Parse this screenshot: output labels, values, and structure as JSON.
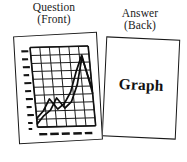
{
  "scene": {
    "kind": "flashcard-illustration",
    "background_color": "#ffffff",
    "ink_color": "#181818"
  },
  "question_card": {
    "caption_line1": "Question",
    "caption_line2": "(Front)",
    "border_color": "#181818",
    "fill_color": "#ffffff"
  },
  "answer_card": {
    "caption_line1": "Answer",
    "caption_line2": "(Back)",
    "label": "Graph",
    "border_color": "#181818",
    "fill_color": "#ffffff"
  },
  "chart_data": {
    "type": "line",
    "title": "",
    "xlabel": "",
    "ylabel": "",
    "grid": true,
    "legend": false,
    "axis_tick_labels_legible": false,
    "y_tick_count": 10,
    "x_tick_count": 5,
    "x_tick_labels": [
      "—",
      "—",
      "—",
      "—",
      "—"
    ],
    "y_tick_labels": [
      "–",
      "–",
      "–",
      "–",
      "–",
      "–",
      "–",
      "–",
      "–",
      "–"
    ],
    "xlim": [
      0,
      10
    ],
    "ylim": [
      0,
      10
    ],
    "series": [
      {
        "name": "series-1",
        "x": [
          0,
          1,
          2,
          3,
          4,
          5,
          6,
          7,
          8
        ],
        "values": [
          0.4,
          1.4,
          2.1,
          3.6,
          2.3,
          3.1,
          5.2,
          8.6,
          4.6
        ]
      },
      {
        "name": "series-2",
        "x": [
          0,
          1,
          2,
          3,
          4,
          5,
          6,
          7,
          8
        ],
        "values": [
          1.1,
          2.0,
          3.5,
          2.2,
          2.9,
          4.3,
          6.8,
          8.9,
          4.1
        ]
      }
    ]
  }
}
